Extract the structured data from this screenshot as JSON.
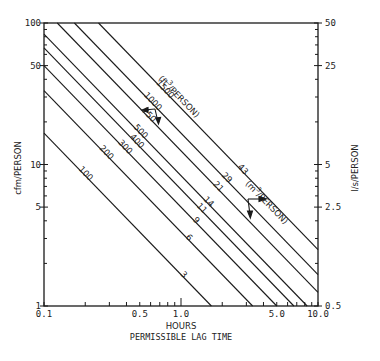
{
  "chart_data": {
    "type": "line",
    "title": "",
    "xlabel": "HOURS",
    "xlabel_sub": "PERMISSIBLE LAG TIME",
    "ylabel_left": "cfm/PERSON",
    "ylabel_right": "l/s/PERSON",
    "xscale": "log",
    "yscale": "log",
    "xlim": [
      0.1,
      10.0
    ],
    "ylim_left": [
      1,
      100
    ],
    "ylim_right": [
      0.5,
      50
    ],
    "x_ticks": [
      {
        "value": 0.1,
        "label": "0.1"
      },
      {
        "value": 0.5,
        "label": "0.5"
      },
      {
        "value": 1.0,
        "label": "1.0"
      },
      {
        "value": 5.0,
        "label": "5.0"
      },
      {
        "value": 10.0,
        "label": "10.0"
      }
    ],
    "y_ticks_left": [
      {
        "value": 1,
        "label": "1"
      },
      {
        "value": 5,
        "label": "5"
      },
      {
        "value": 10,
        "label": "10"
      },
      {
        "value": 50,
        "label": "50"
      },
      {
        "value": 100,
        "label": "100"
      }
    ],
    "y_ticks_right": [
      {
        "value": 0.5,
        "label": "0.5"
      },
      {
        "value": 2.5,
        "label": "2.5"
      },
      {
        "value": 5,
        "label": "5"
      },
      {
        "value": 25,
        "label": "25"
      },
      {
        "value": 50,
        "label": "50"
      }
    ],
    "grid": false,
    "relation": "cfm = volume_ft3 / (60 * hours)",
    "series": [
      {
        "name": "100 ft3/person",
        "ft3": 100,
        "m3": 3,
        "label_ft3": "100",
        "label_m3": "3"
      },
      {
        "name": "200 ft3/person",
        "ft3": 200,
        "m3": 6,
        "label_ft3": "200",
        "label_m3": "6"
      },
      {
        "name": "300 ft3/person",
        "ft3": 300,
        "m3": 9,
        "label_ft3": "300",
        "label_m3": "9"
      },
      {
        "name": "400 ft3/person",
        "ft3": 400,
        "m3": 11,
        "label_ft3": "400",
        "label_m3": "11"
      },
      {
        "name": "500 ft3/person",
        "ft3": 500,
        "m3": 14,
        "label_ft3": "500",
        "label_m3": "14"
      },
      {
        "name": "750 ft3/person",
        "ft3": 750,
        "m3": 21,
        "label_ft3": "750",
        "label_m3": "21"
      },
      {
        "name": "1000 ft3/person",
        "ft3": 1000,
        "m3": 29,
        "label_ft3": "1000",
        "label_m3": "29"
      },
      {
        "name": "1500 ft3/person",
        "ft3": 1500,
        "m3": 43,
        "label_ft3": "1500",
        "label_m3": "43"
      }
    ],
    "annotations": [
      {
        "text": "(ft³/PERSON)",
        "note": "unit label for upper line numbers, with arrow pointing to left axis"
      },
      {
        "text": "(m³/PERSON)",
        "note": "unit label for lower line numbers, with arrow pointing to right axis"
      }
    ],
    "unit_ft3": "(ft",
    "unit_ft3_sup": "3",
    "unit_ft3_tail": "/PERSON)",
    "unit_m3": "(m",
    "unit_m3_sup": "3",
    "unit_m3_tail": "/PERSON)"
  }
}
